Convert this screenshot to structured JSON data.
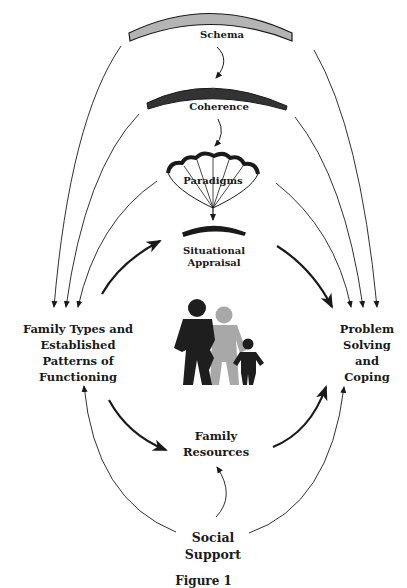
{
  "diagram": {
    "nodes": {
      "schema": "Schema",
      "coherence": "Coherence",
      "paradigms": "Paradigms",
      "situational_appraisal_line1": "Situational",
      "situational_appraisal_line2": "Appraisal",
      "family_types_line1": "Family Types and",
      "family_types_line2": "Established",
      "family_types_line3": "Patterns of",
      "family_types_line4": "Functioning",
      "problem_solving_line1": "Problem",
      "problem_solving_line2": "Solving",
      "problem_solving_line3": "and",
      "problem_solving_line4": "Coping",
      "family_resources_line1": "Family",
      "family_resources_line2": "Resources",
      "social_support_line1": "Social",
      "social_support_line2": "Support"
    },
    "icons": {
      "schema_arc": "light-gray-arc",
      "coherence_arc": "dark-gray-arc",
      "paradigms_symbol": "parachute-icon",
      "appraisal_arc": "black-arc",
      "family_figure": "family-silhouette-icon"
    },
    "colors": {
      "schema_fill": "#b4b4b4",
      "coherence_fill": "#3a3a3a",
      "adult_1": "#1e1e1e",
      "adult_2": "#a8a8a8",
      "child": "#1e1e1e",
      "line": "#1a1a1a"
    },
    "edges": [
      {
        "from": "Schema",
        "to": "Coherence"
      },
      {
        "from": "Coherence",
        "to": "Paradigms"
      },
      {
        "from": "Paradigms",
        "to": "Situational Appraisal"
      },
      {
        "from": "Schema",
        "to": "Family Types and Established Patterns of Functioning"
      },
      {
        "from": "Coherence",
        "to": "Family Types and Established Patterns of Functioning"
      },
      {
        "from": "Paradigms",
        "to": "Family Types and Established Patterns of Functioning"
      },
      {
        "from": "Schema",
        "to": "Problem Solving and Coping"
      },
      {
        "from": "Coherence",
        "to": "Problem Solving and Coping"
      },
      {
        "from": "Paradigms",
        "to": "Problem Solving and Coping"
      },
      {
        "from": "Family Types and Established Patterns of Functioning",
        "to": "Situational Appraisal"
      },
      {
        "from": "Situational Appraisal",
        "to": "Problem Solving and Coping"
      },
      {
        "from": "Family Types and Established Patterns of Functioning",
        "to": "Family Resources"
      },
      {
        "from": "Family Resources",
        "to": "Problem Solving and Coping"
      },
      {
        "from": "Social Support",
        "to": "Family Resources"
      },
      {
        "from": "Social Support",
        "to": "Family Types and Established Patterns of Functioning"
      },
      {
        "from": "Social Support",
        "to": "Problem Solving and Coping"
      }
    ],
    "caption": "Figure 1"
  }
}
